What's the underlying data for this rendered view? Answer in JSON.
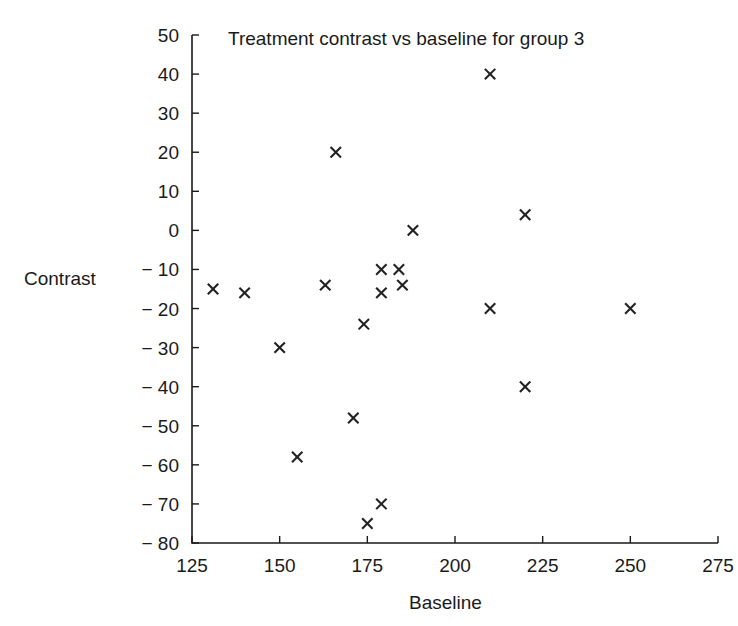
{
  "chart_data": {
    "type": "scatter",
    "title": "Treatment contrast vs baseline for group 3",
    "xlabel": "Baseline",
    "ylabel": "Contrast",
    "xlim": [
      125,
      275
    ],
    "ylim": [
      -80,
      50
    ],
    "xticks": [
      125,
      150,
      175,
      200,
      225,
      250,
      275
    ],
    "yticks": [
      50,
      40,
      30,
      20,
      10,
      0,
      -10,
      -20,
      -30,
      -40,
      -50,
      -60,
      -70,
      -80
    ],
    "xtick_labels": [
      "125",
      "150",
      "175",
      "200",
      "225",
      "250",
      "275"
    ],
    "ytick_labels": [
      "50",
      "40",
      "30",
      "20",
      "10",
      "0",
      "− 10",
      "− 20",
      "− 30",
      "− 40",
      "− 50",
      "− 60",
      "− 70",
      "− 80"
    ],
    "grid": false,
    "legend": false,
    "marker": "x",
    "marker_color": "#222222",
    "points": [
      {
        "x": 131,
        "y": -15
      },
      {
        "x": 140,
        "y": -16
      },
      {
        "x": 150,
        "y": -30
      },
      {
        "x": 155,
        "y": -58
      },
      {
        "x": 163,
        "y": -14
      },
      {
        "x": 166,
        "y": 20
      },
      {
        "x": 171,
        "y": -48
      },
      {
        "x": 174,
        "y": -24
      },
      {
        "x": 175,
        "y": -75
      },
      {
        "x": 179,
        "y": -70
      },
      {
        "x": 179,
        "y": -10
      },
      {
        "x": 179,
        "y": -16
      },
      {
        "x": 184,
        "y": -10
      },
      {
        "x": 185,
        "y": -14
      },
      {
        "x": 188,
        "y": 0
      },
      {
        "x": 210,
        "y": 40
      },
      {
        "x": 210,
        "y": -20
      },
      {
        "x": 220,
        "y": 4
      },
      {
        "x": 220,
        "y": -40
      },
      {
        "x": 250,
        "y": -20
      }
    ]
  }
}
